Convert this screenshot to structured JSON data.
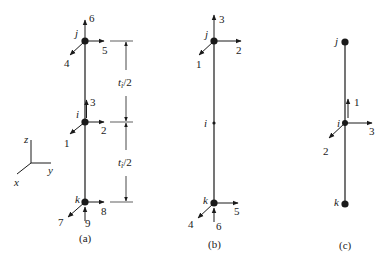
{
  "figure": {
    "panels": [
      {
        "caption": "(a)",
        "nodes": {
          "j": "j",
          "i": "i",
          "k": "k"
        },
        "dofs": {
          "j": {
            "up": "6",
            "right": "5",
            "out": "4"
          },
          "i": {
            "up": "3",
            "right": "2",
            "out": "1"
          },
          "k": {
            "up": "9",
            "right": "8",
            "out": "7"
          }
        },
        "dimensions": {
          "upper": "tᵢ/2",
          "lower": "tᵢ/2",
          "upper_base": "t",
          "upper_sub": "i",
          "upper_tail": "/2"
        }
      },
      {
        "caption": "(b)",
        "nodes": {
          "j": "j",
          "i": "i",
          "k": "k"
        },
        "dofs": {
          "j": {
            "up": "3",
            "right": "2",
            "out": "1"
          },
          "k": {
            "up": "6",
            "right": "5",
            "out": "4"
          }
        }
      },
      {
        "caption": "(c)",
        "nodes": {
          "j": "j",
          "i": "i",
          "k": "k"
        },
        "dofs": {
          "i": {
            "up": "1",
            "right": "3",
            "out": "2"
          }
        }
      }
    ],
    "axes": {
      "z": "z",
      "y": "y",
      "x": "x"
    },
    "colors": {
      "ink": "#1a1a1a",
      "background": "#ffffff"
    }
  }
}
